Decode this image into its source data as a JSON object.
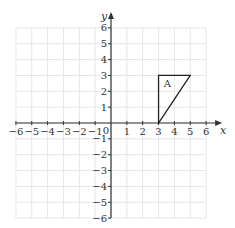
{
  "diagram": {
    "type": "coordinate-grid",
    "x_axis_label": "x",
    "y_axis_label": "y",
    "x_range": [
      -6,
      6
    ],
    "y_range": [
      -6,
      6
    ],
    "origin_label": "0",
    "x_ticks": [
      "-6",
      "-5",
      "-4",
      "-3",
      "-2",
      "-1",
      "1",
      "2",
      "3",
      "4",
      "5",
      "6"
    ],
    "y_ticks": [
      "6",
      "5",
      "4",
      "3",
      "2",
      "1",
      "-1",
      "-2",
      "-3",
      "-4",
      "-5",
      "-6"
    ],
    "shapes": [
      {
        "label": "A",
        "type": "triangle",
        "vertices": [
          [
            3,
            0
          ],
          [
            3,
            3
          ],
          [
            5,
            3
          ]
        ]
      }
    ],
    "colors": {
      "grid": "#e6e6e6",
      "axis": "#333333",
      "shape": "#222222"
    }
  }
}
